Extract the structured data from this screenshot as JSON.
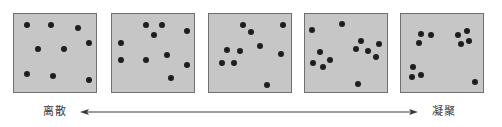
{
  "diagram": {
    "colors": {
      "panel_fill": "#c6c6c6",
      "panel_border": "#707070",
      "dot": "#1e1e1e",
      "arrow": "#3a3a3a",
      "label": "#3a3a3a"
    },
    "axis": {
      "left_label": "离散",
      "right_label": "凝聚",
      "direction": "bidirectional"
    },
    "panels": [
      {
        "name": "panel-1",
        "left": 13,
        "dots": [
          [
            27,
            25
          ],
          [
            51,
            25
          ],
          [
            78,
            28
          ],
          [
            89,
            43
          ],
          [
            38,
            49
          ],
          [
            64,
            49
          ],
          [
            27,
            74
          ],
          [
            53,
            76
          ],
          [
            89,
            80
          ]
        ]
      },
      {
        "name": "panel-2",
        "left": 111,
        "dots": [
          [
            146,
            25
          ],
          [
            162,
            25
          ],
          [
            187,
            31
          ],
          [
            154,
            35
          ],
          [
            121,
            43
          ],
          [
            121,
            60
          ],
          [
            146,
            60
          ],
          [
            167,
            55
          ],
          [
            187,
            65
          ],
          [
            171,
            78
          ]
        ]
      },
      {
        "name": "panel-3",
        "left": 208,
        "dots": [
          [
            243,
            25
          ],
          [
            283,
            25
          ],
          [
            251,
            32
          ],
          [
            260,
            46
          ],
          [
            227,
            50
          ],
          [
            240,
            51
          ],
          [
            281,
            54
          ],
          [
            222,
            63
          ],
          [
            234,
            63
          ],
          [
            267,
            85
          ]
        ]
      },
      {
        "name": "panel-4",
        "left": 304,
        "dots": [
          [
            312,
            30
          ],
          [
            342,
            24
          ],
          [
            361,
            41
          ],
          [
            379,
            44
          ],
          [
            356,
            49
          ],
          [
            368,
            51
          ],
          [
            320,
            52
          ],
          [
            376,
            57
          ],
          [
            330,
            60
          ],
          [
            313,
            63
          ],
          [
            323,
            67
          ],
          [
            358,
            84
          ]
        ]
      },
      {
        "name": "panel-5",
        "left": 400,
        "dots": [
          [
            421,
            34
          ],
          [
            431,
            35
          ],
          [
            419,
            43
          ],
          [
            458,
            35
          ],
          [
            467,
            31
          ],
          [
            461,
            44
          ],
          [
            469,
            41
          ],
          [
            413,
            67
          ],
          [
            412,
            77
          ],
          [
            421,
            75
          ],
          [
            475,
            82
          ]
        ]
      }
    ]
  }
}
